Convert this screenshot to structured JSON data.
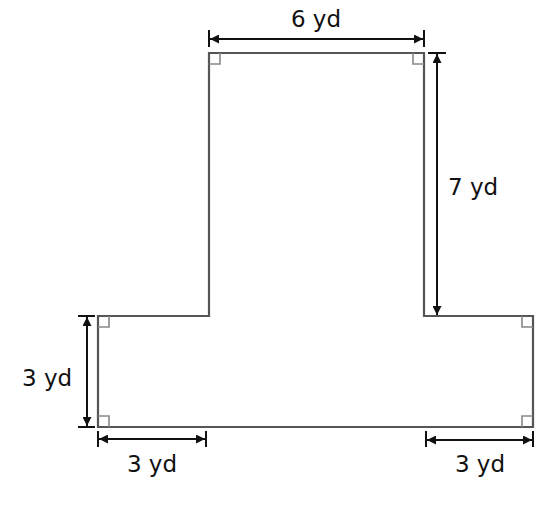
{
  "diagram": {
    "type": "composite-figure",
    "shape": "T-shape",
    "unit": "yd",
    "colors": {
      "outline": "#555555",
      "dimension": "#111111",
      "background": "#ffffff"
    },
    "labels": {
      "top_width": "6 yd",
      "stem_height": "7 yd",
      "base_height": "3 yd",
      "base_left_overhang": "3 yd",
      "base_right_overhang": "3 yd"
    },
    "dimensions": [
      {
        "id": "top_width",
        "value": 6,
        "unit": "yd"
      },
      {
        "id": "stem_height",
        "value": 7,
        "unit": "yd"
      },
      {
        "id": "base_height",
        "value": 3,
        "unit": "yd"
      },
      {
        "id": "base_left_overhang",
        "value": 3,
        "unit": "yd"
      },
      {
        "id": "base_right_overhang",
        "value": 3,
        "unit": "yd"
      }
    ],
    "right_angle_marks": 6
  }
}
